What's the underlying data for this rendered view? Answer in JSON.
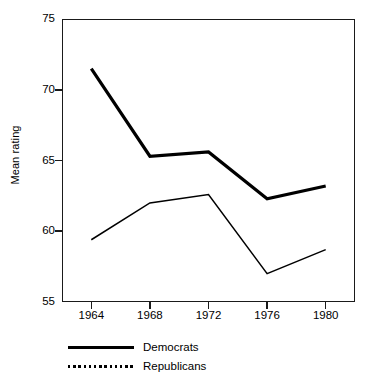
{
  "chart_data": {
    "type": "line",
    "title": "",
    "xlabel": "",
    "ylabel": "Mean rating",
    "categories": [
      "1964",
      "1968",
      "1972",
      "1976",
      "1980"
    ],
    "x": [
      1964,
      1968,
      1972,
      1976,
      1980
    ],
    "xlim": [
      1962,
      1982
    ],
    "ylim": [
      55,
      75
    ],
    "y_ticks": [
      "55",
      "60",
      "65",
      "70",
      "75"
    ],
    "y_tick_values": [
      55,
      60,
      65,
      70,
      75
    ],
    "x_ticks": [
      "1964",
      "1968",
      "1972",
      "1976",
      "1980"
    ],
    "grid": false,
    "legend_position": "below-left",
    "series": [
      {
        "name": "Democrats",
        "style": "solid-thick",
        "color": "#000000",
        "values": [
          71.5,
          65.3,
          65.6,
          62.3,
          63.2
        ]
      },
      {
        "name": "Republicans",
        "style": "dotted",
        "color": "#000000",
        "values": [
          59.4,
          62.0,
          62.6,
          57.0,
          58.7
        ]
      }
    ]
  },
  "axes": {
    "y_title": "Mean rating"
  },
  "legend": {
    "items": [
      {
        "label": "Democrats",
        "swatch": "solid-thick-line-icon"
      },
      {
        "label": "Republicans",
        "swatch": "dotted-line-icon"
      }
    ]
  }
}
